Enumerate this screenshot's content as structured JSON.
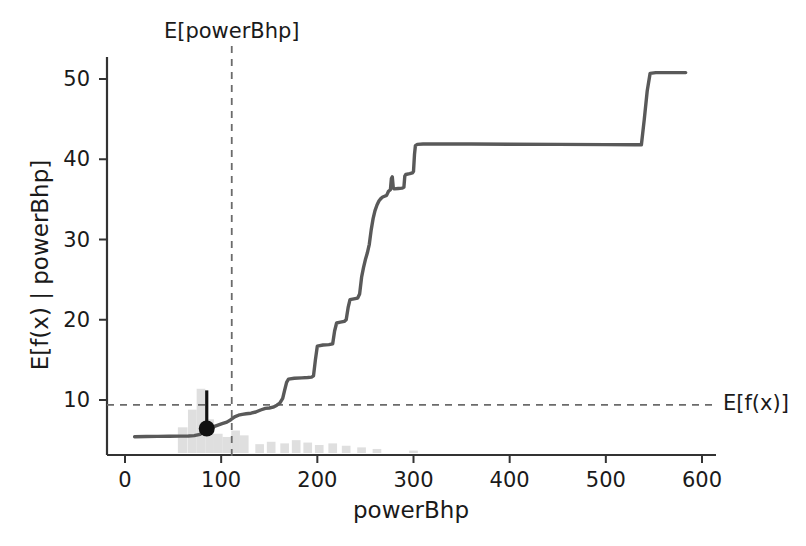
{
  "chart_data": {
    "type": "line",
    "title": "",
    "xlabel": "powerBhp",
    "ylabel": "E[f(x) | powerBhp]",
    "xlim": [
      -5,
      625
    ],
    "ylim": [
      3.2,
      54.5
    ],
    "xticks": [
      0,
      100,
      200,
      300,
      400,
      500,
      600
    ],
    "yticks": [
      10,
      20,
      30,
      40,
      50
    ],
    "grid": false,
    "legend": null,
    "line_color": "#595959",
    "marker_color": "#111111",
    "rug_color": "#d9d9d9",
    "annotations": [
      {
        "name": "E[powerBhp]",
        "type": "vline",
        "x": 111,
        "label": "E[powerBhp]",
        "style": "dashed",
        "color": "#666666"
      },
      {
        "name": "E[f(x)]",
        "type": "hline",
        "y": 9.4,
        "label": "E[f(x)]",
        "style": "dashed",
        "color": "#666666"
      },
      {
        "name": "ice-point-marker",
        "type": "point",
        "x": 85,
        "y": 6.45,
        "whisker_top": 11.2
      }
    ],
    "series": [
      {
        "name": "pdp",
        "points": [
          [
            10,
            5.42
          ],
          [
            22,
            5.45
          ],
          [
            34,
            5.46
          ],
          [
            46,
            5.48
          ],
          [
            58,
            5.5
          ],
          [
            66,
            5.52
          ],
          [
            72,
            5.56
          ],
          [
            78,
            5.72
          ],
          [
            82,
            6.1
          ],
          [
            85,
            6.45
          ],
          [
            90,
            6.6
          ],
          [
            96,
            6.85
          ],
          [
            101,
            7.05
          ],
          [
            106,
            7.25
          ],
          [
            110,
            7.55
          ],
          [
            114,
            7.9
          ],
          [
            118,
            8.1
          ],
          [
            122,
            8.2
          ],
          [
            126,
            8.28
          ],
          [
            131,
            8.35
          ],
          [
            136,
            8.5
          ],
          [
            141,
            8.75
          ],
          [
            146,
            8.95
          ],
          [
            150,
            9.0
          ],
          [
            154,
            9.1
          ],
          [
            158,
            9.35
          ],
          [
            161,
            9.6
          ],
          [
            164,
            10.2
          ],
          [
            166,
            11.2
          ],
          [
            168,
            12.2
          ],
          [
            170,
            12.6
          ],
          [
            176,
            12.7
          ],
          [
            184,
            12.75
          ],
          [
            190,
            12.8
          ],
          [
            194,
            12.85
          ],
          [
            196,
            13.0
          ],
          [
            198,
            15.0
          ],
          [
            200,
            16.7
          ],
          [
            206,
            16.85
          ],
          [
            212,
            16.9
          ],
          [
            216,
            17.0
          ],
          [
            218,
            18.6
          ],
          [
            220,
            19.6
          ],
          [
            224,
            19.7
          ],
          [
            228,
            19.8
          ],
          [
            230,
            20.0
          ],
          [
            232,
            21.5
          ],
          [
            234,
            22.5
          ],
          [
            238,
            22.6
          ],
          [
            242,
            22.7
          ],
          [
            244,
            23.2
          ],
          [
            246,
            25.3
          ],
          [
            248,
            26.5
          ],
          [
            250,
            27.5
          ],
          [
            252,
            28.3
          ],
          [
            254,
            29.4
          ],
          [
            256,
            31.2
          ],
          [
            258,
            32.6
          ],
          [
            260,
            33.6
          ],
          [
            262,
            34.3
          ],
          [
            264,
            34.8
          ],
          [
            266,
            35.1
          ],
          [
            268,
            35.3
          ],
          [
            270,
            35.4
          ],
          [
            272,
            35.5
          ],
          [
            274,
            36.0
          ],
          [
            276,
            36.2
          ],
          [
            277,
            37.6
          ],
          [
            278,
            37.8
          ],
          [
            279,
            36.4
          ],
          [
            280,
            36.3
          ],
          [
            284,
            36.35
          ],
          [
            288,
            36.4
          ],
          [
            290,
            36.5
          ],
          [
            291,
            37.9
          ],
          [
            292,
            38.1
          ],
          [
            296,
            38.2
          ],
          [
            299,
            38.3
          ],
          [
            300,
            38.5
          ],
          [
            301,
            40.6
          ],
          [
            302,
            41.7
          ],
          [
            304,
            41.85
          ],
          [
            310,
            41.9
          ],
          [
            330,
            41.9
          ],
          [
            360,
            41.9
          ],
          [
            400,
            41.88
          ],
          [
            450,
            41.85
          ],
          [
            500,
            41.83
          ],
          [
            530,
            41.8
          ],
          [
            537,
            41.8
          ],
          [
            540,
            45.0
          ],
          [
            543,
            48.5
          ],
          [
            546,
            50.7
          ],
          [
            552,
            50.8
          ],
          [
            570,
            50.8
          ],
          [
            583,
            50.8
          ]
        ]
      }
    ],
    "rug_histogram": [
      {
        "x": 60,
        "h": 3.2,
        "w": 10
      },
      {
        "x": 70,
        "h": 5.4,
        "w": 9
      },
      {
        "x": 79,
        "h": 8.0,
        "w": 9
      },
      {
        "x": 88,
        "h": 4.2,
        "w": 9
      },
      {
        "x": 97,
        "h": 2.4,
        "w": 9
      },
      {
        "x": 106,
        "h": 2.0,
        "w": 9
      },
      {
        "x": 115,
        "h": 2.8,
        "w": 9
      },
      {
        "x": 124,
        "h": 2.2,
        "w": 9
      },
      {
        "x": 140,
        "h": 1.1,
        "w": 9
      },
      {
        "x": 152,
        "h": 1.4,
        "w": 9
      },
      {
        "x": 166,
        "h": 1.2,
        "w": 9
      },
      {
        "x": 178,
        "h": 1.6,
        "w": 9
      },
      {
        "x": 190,
        "h": 1.3,
        "w": 9
      },
      {
        "x": 202,
        "h": 1.0,
        "w": 9
      },
      {
        "x": 216,
        "h": 1.2,
        "w": 9
      },
      {
        "x": 230,
        "h": 0.9,
        "w": 9
      },
      {
        "x": 246,
        "h": 0.7,
        "w": 9
      },
      {
        "x": 262,
        "h": 0.5,
        "w": 9
      },
      {
        "x": 300,
        "h": 0.3,
        "w": 9
      }
    ]
  },
  "axes": {
    "xlabel": "powerBhp",
    "ylabel": "E[f(x) | powerBhp]",
    "x_tick_labels": [
      "0",
      "100",
      "200",
      "300",
      "400",
      "500",
      "600"
    ],
    "y_tick_labels": [
      "10",
      "20",
      "30",
      "40",
      "50"
    ]
  },
  "labels": {
    "vline": "E[powerBhp]",
    "hline": "E[f(x)]"
  }
}
